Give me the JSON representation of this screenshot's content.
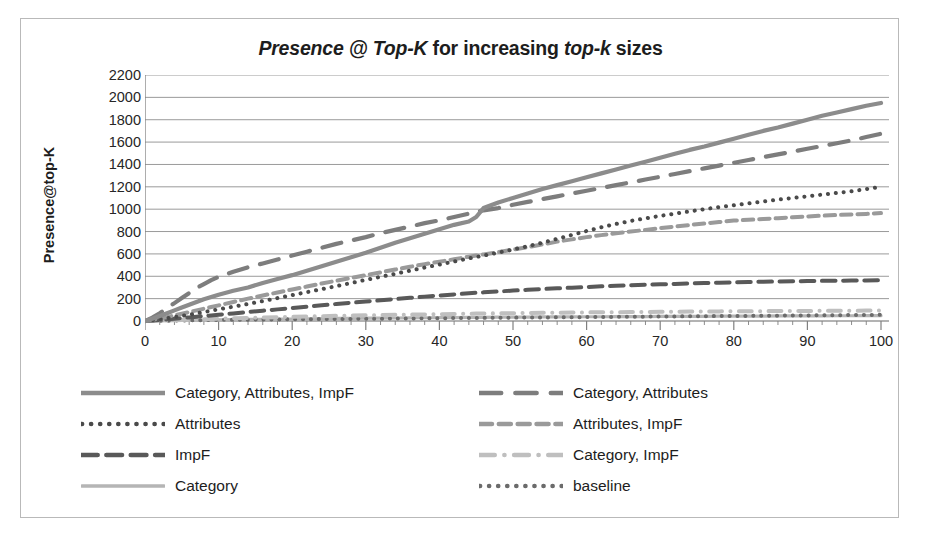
{
  "chart_data": {
    "type": "line",
    "title": "Presence @ Top-K for increasing top-k sizes",
    "title_parts": {
      "part1_italic": "Presence @ Top-K",
      "part2": " for increasing ",
      "part3_italic": "top-k",
      "part4": " sizes"
    },
    "xlabel": "",
    "ylabel": "Presence@top-K",
    "xlim": [
      0,
      100
    ],
    "ylim": [
      0,
      2200
    ],
    "ytick_step": 200,
    "xtick_step": 10,
    "grid": "horizontal",
    "legend_position": "bottom",
    "xticks": [
      "0",
      "10",
      "20",
      "30",
      "40",
      "50",
      "60",
      "70",
      "80",
      "90",
      "100"
    ],
    "yticks": [
      "2200",
      "2000",
      "1800",
      "1600",
      "1400",
      "1200",
      "1000",
      "800",
      "600",
      "400",
      "200",
      "0"
    ],
    "x": [
      0,
      1,
      2,
      3,
      4,
      5,
      6,
      7,
      8,
      9,
      10,
      12,
      14,
      16,
      18,
      20,
      22,
      24,
      26,
      28,
      30,
      32,
      34,
      36,
      38,
      40,
      42,
      44,
      45,
      46,
      48,
      50,
      52,
      54,
      56,
      58,
      60,
      62,
      64,
      66,
      68,
      70,
      72,
      74,
      76,
      78,
      80,
      82,
      84,
      86,
      88,
      90,
      92,
      94,
      96,
      98,
      100
    ],
    "series": [
      {
        "name": "Category, Attributes, ImpF",
        "style": "solid",
        "color": "#8c8c8c",
        "width": 4.2,
        "values": [
          0,
          20,
          45,
          70,
          95,
          120,
          145,
          170,
          195,
          215,
          235,
          270,
          300,
          340,
          375,
          410,
          450,
          490,
          530,
          570,
          610,
          655,
          700,
          740,
          780,
          820,
          860,
          890,
          930,
          1010,
          1060,
          1100,
          1140,
          1180,
          1215,
          1250,
          1285,
          1320,
          1355,
          1390,
          1425,
          1460,
          1495,
          1530,
          1560,
          1595,
          1630,
          1665,
          1700,
          1730,
          1765,
          1800,
          1835,
          1865,
          1895,
          1925,
          1950
        ]
      },
      {
        "name": "Category, Attributes",
        "style": "long-dash",
        "color": "#7d7d7d",
        "width": 4.2,
        "values": [
          0,
          30,
          70,
          115,
          160,
          205,
          250,
          295,
          330,
          365,
          395,
          440,
          480,
          515,
          550,
          585,
          620,
          655,
          690,
          720,
          750,
          785,
          815,
          845,
          875,
          900,
          930,
          960,
          975,
          990,
          1010,
          1040,
          1065,
          1090,
          1115,
          1140,
          1165,
          1190,
          1215,
          1240,
          1265,
          1290,
          1315,
          1340,
          1365,
          1390,
          1415,
          1440,
          1465,
          1490,
          1515,
          1540,
          1565,
          1590,
          1615,
          1645,
          1675
        ]
      },
      {
        "name": "Attributes",
        "style": "dotted",
        "color": "#4a4a4a",
        "width": 4.0,
        "values": [
          0,
          8,
          16,
          25,
          35,
          45,
          56,
          68,
          80,
          92,
          105,
          128,
          152,
          178,
          205,
          232,
          258,
          285,
          312,
          340,
          368,
          395,
          422,
          450,
          478,
          505,
          532,
          560,
          572,
          585,
          612,
          640,
          668,
          700,
          735,
          770,
          805,
          838,
          868,
          895,
          918,
          940,
          960,
          980,
          1000,
          1018,
          1035,
          1052,
          1068,
          1085,
          1100,
          1115,
          1130,
          1145,
          1160,
          1180,
          1200
        ]
      },
      {
        "name": "Attributes, ImpF",
        "style": "dash",
        "color": "#9a9a9a",
        "width": 4.0,
        "values": [
          0,
          10,
          22,
          35,
          50,
          65,
          80,
          95,
          110,
          125,
          140,
          170,
          200,
          228,
          255,
          282,
          308,
          335,
          360,
          385,
          410,
          435,
          460,
          485,
          508,
          530,
          552,
          575,
          585,
          595,
          615,
          638,
          660,
          685,
          710,
          730,
          750,
          768,
          785,
          800,
          815,
          830,
          845,
          858,
          872,
          885,
          898,
          905,
          912,
          920,
          928,
          935,
          942,
          948,
          952,
          958,
          965
        ]
      },
      {
        "name": "ImpF",
        "style": "med-dash",
        "color": "#595959",
        "width": 4.0,
        "values": [
          0,
          5,
          10,
          15,
          20,
          26,
          32,
          38,
          44,
          50,
          56,
          68,
          80,
          92,
          104,
          116,
          128,
          140,
          152,
          163,
          174,
          185,
          196,
          207,
          218,
          228,
          238,
          248,
          252,
          256,
          264,
          272,
          279,
          286,
          292,
          298,
          304,
          310,
          315,
          320,
          324,
          328,
          332,
          336,
          340,
          343,
          346,
          349,
          351,
          353,
          355,
          357,
          359,
          360,
          362,
          363,
          365
        ]
      },
      {
        "name": "Category, ImpF",
        "style": "dash-dot",
        "color": "#bfbfbf",
        "width": 4.0,
        "values": [
          0,
          2,
          4,
          6,
          8,
          10,
          12,
          14,
          16,
          18,
          20,
          24,
          28,
          31,
          34,
          37,
          40,
          43,
          46,
          48,
          51,
          53,
          55,
          57,
          59,
          61,
          63,
          65,
          66,
          67,
          69,
          70,
          72,
          73,
          74,
          76,
          77,
          78,
          79,
          80,
          81,
          82,
          83,
          84,
          85,
          86,
          87,
          88,
          88,
          89,
          90,
          90,
          91,
          92,
          92,
          93,
          94
        ]
      },
      {
        "name": "Category",
        "style": "solid",
        "color": "#b5b5b5",
        "width": 3.2,
        "values": [
          0,
          1,
          2,
          3,
          4,
          5,
          6,
          7,
          8,
          9,
          10,
          12,
          14,
          15,
          17,
          18,
          20,
          21,
          23,
          24,
          25,
          26,
          27,
          28,
          29,
          30,
          31,
          32,
          32,
          33,
          34,
          34,
          35,
          36,
          36,
          37,
          38,
          38,
          39,
          40,
          40,
          41,
          41,
          42,
          42,
          43,
          43,
          44,
          44,
          45,
          45,
          46,
          46,
          47,
          47,
          48,
          48
        ]
      },
      {
        "name": "baseline",
        "style": "dotted",
        "color": "#6b6b6b",
        "width": 4.0,
        "values": [
          0,
          1,
          2,
          3,
          4,
          5,
          6,
          7,
          8,
          9,
          10,
          11,
          12,
          13,
          14,
          15,
          16,
          17,
          18,
          19,
          20,
          21,
          22,
          23,
          24,
          25,
          26,
          27,
          27,
          28,
          29,
          30,
          31,
          32,
          33,
          34,
          35,
          36,
          37,
          38,
          39,
          40,
          41,
          42,
          43,
          44,
          45,
          46,
          47,
          48,
          49,
          50,
          51,
          52,
          53,
          54,
          55
        ]
      }
    ],
    "legend": {
      "left_column": [
        {
          "label": "Category, Attributes, ImpF",
          "swatch": "solid",
          "color": "#8c8c8c"
        },
        {
          "label": "Attributes",
          "swatch": "dotted",
          "color": "#4a4a4a"
        },
        {
          "label": "ImpF",
          "swatch": "med-dash",
          "color": "#595959"
        },
        {
          "label": "Category",
          "swatch": "solid-thin",
          "color": "#b5b5b5"
        }
      ],
      "right_column": [
        {
          "label": "Category, Attributes",
          "swatch": "long-dash",
          "color": "#7d7d7d"
        },
        {
          "label": "Attributes, ImpF",
          "swatch": "dash",
          "color": "#9a9a9a"
        },
        {
          "label": "Category, ImpF",
          "swatch": "dash-dot",
          "color": "#bfbfbf"
        },
        {
          "label": "baseline",
          "swatch": "dotted",
          "color": "#6b6b6b"
        }
      ]
    },
    "colors": {
      "grid": "#9a9a9a",
      "axis": "#808080",
      "border": "#b9b9b9",
      "text": "#1d1d1d"
    }
  }
}
